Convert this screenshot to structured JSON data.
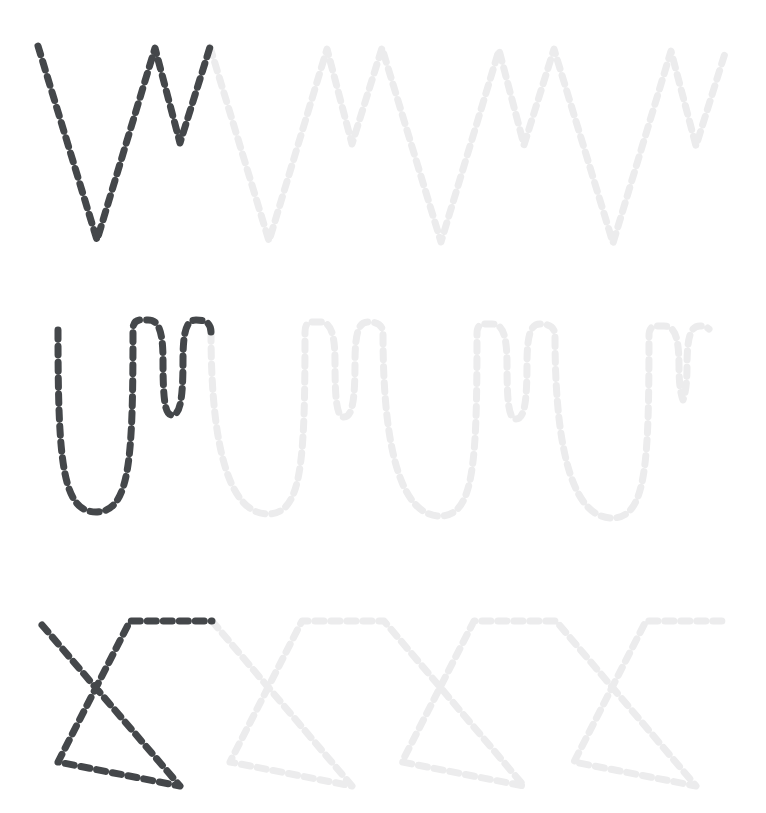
{
  "page": {
    "background_color": "#ffffff",
    "width": 766,
    "height": 813
  },
  "style": {
    "traced_color": "#44474a",
    "guide_color": "#ececed",
    "stroke_width": 7,
    "dash_pattern": "9 7",
    "line_cap": "round"
  },
  "rows": [
    {
      "id": "row-zigzag-vw",
      "label": "Zigzag V-W pattern",
      "shape": "sharp-zigzag",
      "row_index": 1,
      "repeat_period": 172,
      "top_y": 46,
      "bottom_y": 240,
      "mid_y": 143,
      "start_x": 38,
      "traced_segments": 1,
      "guide_segments": 3,
      "traced_path": "M38,46 L97,240 L155,48 L180,143 L210,47",
      "guide_path": "M210,47 L269,241 L327,49 L352,144 L382,48 L441,242 L499,50 L524,145 L554,49 L613,243 L671,51 L696,146 L726,50"
    },
    {
      "id": "row-curve-uw",
      "label": "Rounded U-W cursive pattern",
      "shape": "rounded-wave",
      "row_index": 2,
      "repeat_period": 172,
      "top_y": 320,
      "bottom_y": 512,
      "mid_y": 415,
      "start_x": 58,
      "traced_segments": 1,
      "guide_segments": 3,
      "traced_path": "M58,330 C58,460 62,512 96,512 C130,512 133,460 133,330 C133,318 140,320 148,320 C157,320 163,327 163,360 C163,400 165,415 172,415 C180,415 183,400 183,360 C183,327 188,320 196,320 C204,320 211,322 211,332",
      "guide_path": "M211,332 C211,462 234,514 268,514 C302,514 305,462 305,332 C305,320 312,322 320,322 C329,322 335,329 335,362 C335,402 337,417 344,417 C352,417 355,402 355,362 C355,329 360,322 368,322 C376,322 383,324 383,334 C383,464 406,516 440,516 C474,516 477,464 477,334 C477,322 484,324 492,324 C501,324 507,331 507,364 C507,404 509,419 516,419 C524,419 527,404 527,364 C527,331 532,324 540,324 C548,324 555,326 555,336 C555,466 578,518 612,518 C646,518 649,466 649,336 C649,324 656,326 664,326 C673,326 679,333 679,366 C679,380 680,392 683,400 C686,392 687,380 687,366 C687,333 692,326 700,326 C704,326 707,327 709,329"
    },
    {
      "id": "row-crossed-z",
      "label": "Crossed Z zigzag pattern",
      "shape": "crossed-zigzag",
      "row_index": 3,
      "repeat_period": 172,
      "top_y": 621,
      "bottom_y": 786,
      "corner_y": 762,
      "start_x": 42,
      "traced_segments": 1,
      "guide_segments": 3,
      "traced_path": "M42,625 L180,786 L58,762 L130,621 L212,621",
      "guide_path": "M212,621 L352,786 L230,762 L302,621 L384,621 L524,786 L402,762 L474,621 L556,621 L696,786 L574,762 L646,621 L728,621"
    }
  ]
}
